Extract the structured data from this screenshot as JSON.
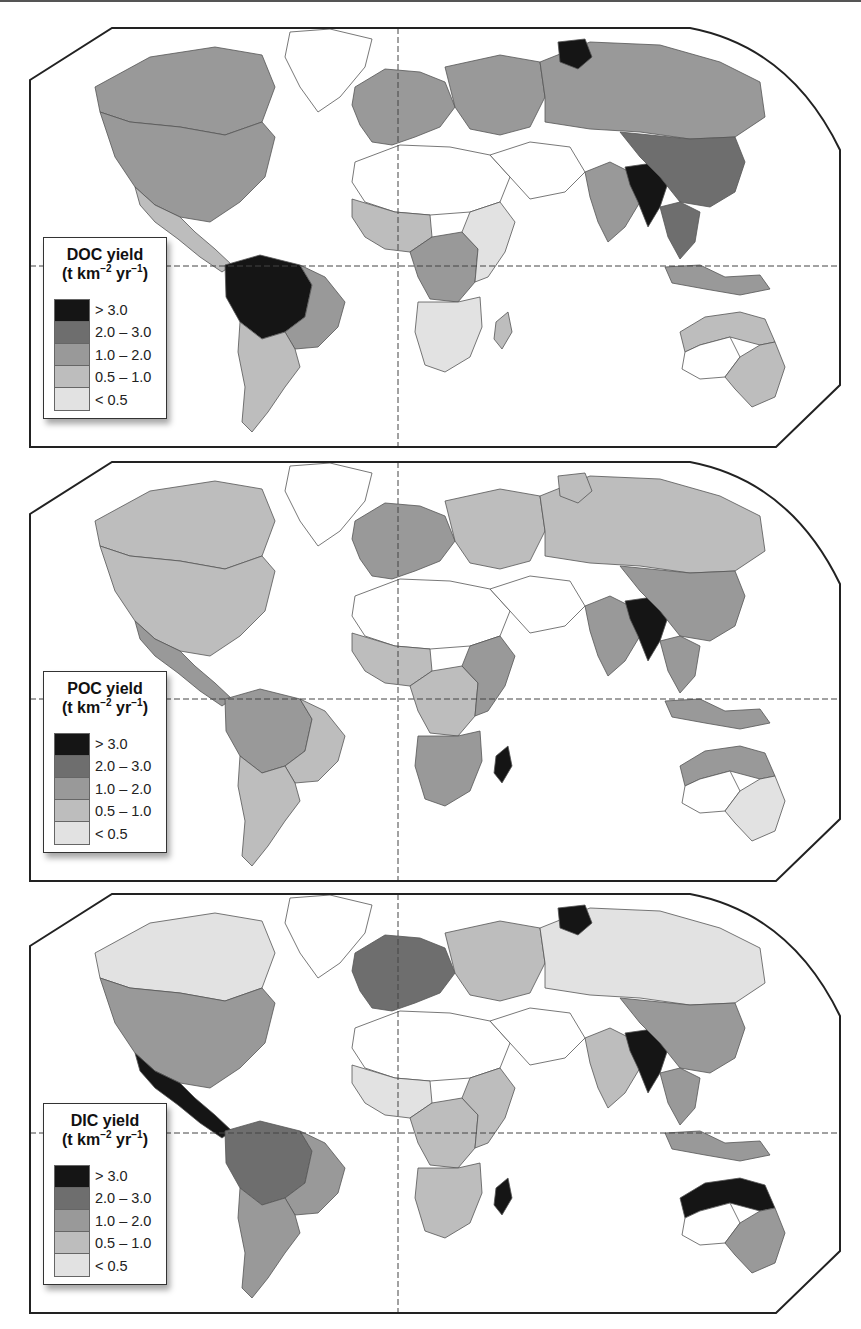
{
  "figure": {
    "type": "choropleth-world-maps",
    "panel_count": 3
  },
  "legend_classes": [
    {
      "label": "> 3.0",
      "color": "#151515"
    },
    {
      "label": "2.0 – 3.0",
      "color": "#6e6e6e"
    },
    {
      "label": "1.0 – 2.0",
      "color": "#999999"
    },
    {
      "label": "0.5 – 1.0",
      "color": "#bdbdbd"
    },
    {
      "label": "< 0.5",
      "color": "#e2e2e2"
    }
  ],
  "panels": [
    {
      "id": "doc",
      "legend_title": "DOC yield",
      "legend_unit_prefix": "(t km",
      "legend_unit_exp1": "−2",
      "legend_unit_mid": " yr",
      "legend_unit_exp2": "−1",
      "legend_unit_suffix": ")",
      "labels": [
        "> 3.0",
        "2.0 – 3.0",
        "1.0 – 2.0",
        "0.5 – 1.0",
        "< 0.5"
      ],
      "regions": {
        "north_america": "#999999",
        "canada_north": "#999999",
        "greenland": "#ffffff",
        "central_america": "#bdbdbd",
        "amazon": "#151515",
        "south_america_east": "#999999",
        "south_america_south": "#bdbdbd",
        "parana_hotspot": "#151515",
        "europe": "#999999",
        "russia_west": "#999999",
        "siberia": "#999999",
        "siberia_hotspot": "#151515",
        "africa_north": "#ffffff",
        "africa_west": "#bdbdbd",
        "congo": "#999999",
        "africa_east": "#e2e2e2",
        "africa_south": "#e2e2e2",
        "madagascar": "#bdbdbd",
        "middle_east": "#ffffff",
        "india": "#999999",
        "himalaya_hotspot": "#151515",
        "china": "#6e6e6e",
        "se_asia": "#6e6e6e",
        "indonesia": "#999999",
        "australia_north": "#bdbdbd",
        "australia_east": "#bdbdbd",
        "australia_interior": "#ffffff"
      }
    },
    {
      "id": "poc",
      "legend_title": "POC yield",
      "legend_unit_prefix": "(t km",
      "legend_unit_exp1": "−2",
      "legend_unit_mid": " yr",
      "legend_unit_exp2": "−1",
      "legend_unit_suffix": ")",
      "labels": [
        "> 3.0",
        "2.0 – 3.0",
        "1.0 – 2.0",
        "0.5 – 1.0",
        "< 0.5"
      ],
      "regions": {
        "north_america": "#bdbdbd",
        "canada_north": "#bdbdbd",
        "greenland": "#ffffff",
        "central_america": "#999999",
        "amazon": "#999999",
        "south_america_east": "#bdbdbd",
        "south_america_south": "#bdbdbd",
        "parana_hotspot": "#bdbdbd",
        "europe": "#999999",
        "russia_west": "#bdbdbd",
        "siberia": "#bdbdbd",
        "siberia_hotspot": "#bdbdbd",
        "africa_north": "#ffffff",
        "africa_west": "#bdbdbd",
        "congo": "#bdbdbd",
        "africa_east": "#999999",
        "africa_south": "#999999",
        "madagascar": "#151515",
        "middle_east": "#ffffff",
        "india": "#999999",
        "himalaya_hotspot": "#151515",
        "china": "#999999",
        "se_asia": "#999999",
        "indonesia": "#999999",
        "australia_north": "#999999",
        "australia_east": "#e2e2e2",
        "australia_interior": "#ffffff"
      }
    },
    {
      "id": "dic",
      "legend_title": "DIC yield",
      "legend_unit_prefix": "(t km",
      "legend_unit_exp1": "−2",
      "legend_unit_mid": " yr",
      "legend_unit_exp2": "−1",
      "legend_unit_suffix": ")",
      "labels": [
        "> 3.0",
        "2.0 – 3.0",
        "1.0 – 2.0",
        "0.5 – 1.0",
        "< 0.5"
      ],
      "regions": {
        "north_america": "#999999",
        "canada_north": "#e2e2e2",
        "greenland": "#ffffff",
        "central_america": "#151515",
        "amazon": "#6e6e6e",
        "south_america_east": "#999999",
        "south_america_south": "#999999",
        "parana_hotspot": "#151515",
        "europe": "#6e6e6e",
        "russia_west": "#bdbdbd",
        "siberia": "#e2e2e2",
        "siberia_hotspot": "#151515",
        "africa_north": "#ffffff",
        "africa_west": "#e2e2e2",
        "congo": "#bdbdbd",
        "africa_east": "#bdbdbd",
        "africa_south": "#bdbdbd",
        "madagascar": "#151515",
        "middle_east": "#ffffff",
        "india": "#bdbdbd",
        "himalaya_hotspot": "#151515",
        "china": "#999999",
        "se_asia": "#999999",
        "indonesia": "#999999",
        "australia_north": "#151515",
        "australia_east": "#999999",
        "australia_interior": "#ffffff"
      }
    }
  ]
}
